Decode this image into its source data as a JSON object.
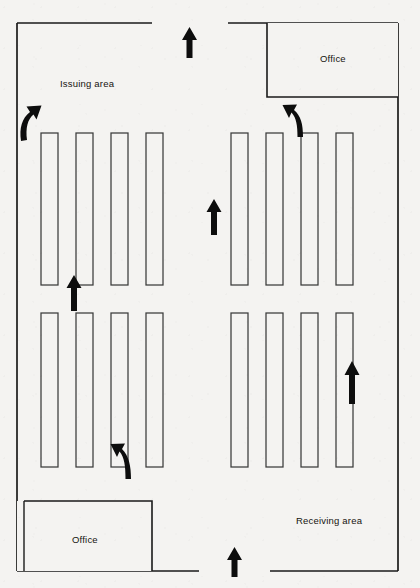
{
  "diagram": {
    "background_color": "#f4f3f1",
    "line_color": "#1a1a1a",
    "arrow_color": "#0d0d0d",
    "rack_fill": "#f4f3f1",
    "areas": [
      {
        "id": "issuing-area",
        "label": "Issuing area",
        "x": 60,
        "y": 83
      },
      {
        "id": "receiving-area",
        "label": "Receiving area",
        "x": 296,
        "y": 521
      },
      {
        "id": "office-top-right",
        "label": "Office",
        "x": 322,
        "y": 62
      },
      {
        "id": "office-bottom-left",
        "label": "Office",
        "x": 74,
        "y": 540
      }
    ],
    "office_rooms": [
      {
        "id": "office-top-right",
        "x": 267,
        "y": 25,
        "width": 131,
        "height": 72
      },
      {
        "id": "office-bottom-left",
        "x": 24,
        "y": 501,
        "width": 128,
        "height": 70
      }
    ],
    "racks": {
      "count": 16,
      "rows": 2,
      "columns_per_group": 4,
      "groups": 2,
      "width": 17,
      "upper_row": {
        "y": 133,
        "height": 152
      },
      "lower_row": {
        "y": 313,
        "height": 154
      },
      "x_positions": [
        41,
        76,
        111,
        146,
        231,
        266,
        301,
        336
      ]
    },
    "arrows": [
      {
        "id": "arrow-top-dock",
        "kind": "straight",
        "direction": "up",
        "x": 190,
        "y": 30
      },
      {
        "id": "arrow-bottom-dock",
        "kind": "straight",
        "direction": "up",
        "x": 235,
        "y": 552
      },
      {
        "id": "arrow-center-aisle",
        "kind": "straight",
        "direction": "up",
        "x": 214,
        "y": 205
      },
      {
        "id": "arrow-left-aisle-mid",
        "kind": "straight",
        "direction": "up",
        "x": 74,
        "y": 280
      },
      {
        "id": "arrow-right-aisle-lower",
        "kind": "straight",
        "direction": "up",
        "x": 352,
        "y": 365
      },
      {
        "id": "arrow-issuing-left-turn",
        "kind": "curved",
        "direction": "up-right",
        "x": 24,
        "y": 112
      },
      {
        "id": "arrow-office-right-turn",
        "kind": "curved",
        "direction": "up-left",
        "x": 292,
        "y": 108
      },
      {
        "id": "arrow-lower-left-turn",
        "kind": "curved",
        "direction": "up-left",
        "x": 116,
        "y": 440
      }
    ],
    "wall_openings": [
      {
        "id": "opening-top",
        "side": "top",
        "from": 152,
        "to": 228
      },
      {
        "id": "opening-bottom",
        "side": "bottom",
        "from": 199,
        "to": 270
      }
    ]
  }
}
